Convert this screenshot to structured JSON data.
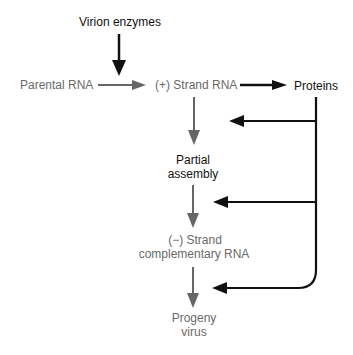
{
  "diagram": {
    "colors": {
      "primary": "#111111",
      "secondary": "#6a6a6a",
      "gray_arrow": "#666666"
    },
    "nodes": {
      "virion_enzymes": "Virion enzymes",
      "parental_rna": "Parental RNA",
      "plus_strand_rna": "(+) Strand RNA",
      "proteins": "Proteins",
      "partial_assembly_1": "Partial",
      "partial_assembly_2": "assembly",
      "minus_strand_1": "(−) Strand",
      "minus_strand_2": "complementary RNA",
      "progeny_virus_1": "Progeny",
      "progeny_virus_2": "virus"
    },
    "edges": [
      {
        "from": "Virion enzymes",
        "to": "Parental RNA → (+) Strand RNA",
        "color": "black"
      },
      {
        "from": "Parental RNA",
        "to": "(+) Strand RNA",
        "color": "gray"
      },
      {
        "from": "(+) Strand RNA",
        "to": "Proteins",
        "color": "black"
      },
      {
        "from": "(+) Strand RNA",
        "to": "Partial assembly",
        "color": "gray"
      },
      {
        "from": "Proteins",
        "to": "(+) Strand RNA → Partial assembly",
        "color": "black"
      },
      {
        "from": "Partial assembly",
        "to": "(−) Strand complementary RNA",
        "color": "gray"
      },
      {
        "from": "Proteins",
        "to": "Partial assembly → (−) Strand complementary RNA",
        "color": "black"
      },
      {
        "from": "(−) Strand complementary RNA",
        "to": "Progeny virus",
        "color": "gray"
      },
      {
        "from": "Proteins",
        "to": "(−) Strand complementary RNA → Progeny virus",
        "color": "black"
      }
    ]
  }
}
